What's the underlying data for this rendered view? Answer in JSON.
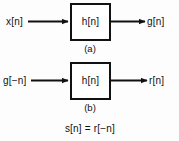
{
  "figure": {
    "background_color": "#fdfdfd",
    "line_color": "#111111",
    "block_fill": "#ffffff",
    "diagrams": [
      {
        "id": "a",
        "input_label": "x[n]",
        "system_label": "h[n]",
        "output_label": "g[n]",
        "caption": "(a)"
      },
      {
        "id": "b",
        "input_label": "g[−n]",
        "system_label": "h[n]",
        "output_label": "r[n]",
        "caption": "(b)"
      }
    ],
    "equation": "s[n] = r[−n]"
  }
}
